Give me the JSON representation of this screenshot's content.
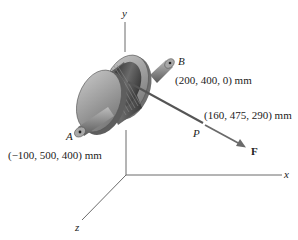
{
  "diagram": {
    "type": "3d-statics-spool",
    "axes": {
      "x_label": "x",
      "y_label": "y",
      "z_label": "z"
    },
    "points": {
      "A": {
        "label": "A",
        "coords": "(−100, 500, 400) mm"
      },
      "B": {
        "label": "B",
        "coords": "(200, 400, 0) mm"
      },
      "P": {
        "label": "P",
        "coords": "(160, 475, 290) mm"
      }
    },
    "force": {
      "label": "F"
    },
    "colors": {
      "axis": "#6b6b6b",
      "spool_body": "#9a9a9a",
      "spool_dark": "#4a4a4a",
      "cable": "#555555",
      "force_arrow": "#6a6a6a"
    }
  }
}
